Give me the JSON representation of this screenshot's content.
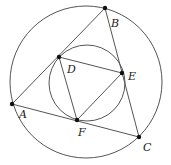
{
  "diagram": {
    "stroke_color": "#555555",
    "point_color": "#111111",
    "outer_circle": {
      "cx": 86,
      "cy": 82,
      "r": 76
    },
    "inner_circle": {
      "cx": 87,
      "cy": 83,
      "r": 38
    },
    "points": {
      "A": {
        "x": 12,
        "y": 104,
        "label": "A",
        "lx": 19,
        "ly": 118
      },
      "B": {
        "x": 105,
        "y": 8,
        "label": "B",
        "lx": 111,
        "ly": 27
      },
      "C": {
        "x": 139,
        "y": 137,
        "label": "C",
        "lx": 143,
        "ly": 151
      },
      "D": {
        "x": 59,
        "y": 57,
        "label": "D",
        "lx": 67,
        "ly": 73
      },
      "E": {
        "x": 122,
        "y": 73,
        "label": "E",
        "lx": 128,
        "ly": 80
      },
      "F": {
        "x": 77,
        "y": 120,
        "label": "F",
        "lx": 78,
        "ly": 136
      }
    },
    "segments": [
      [
        "A",
        "B"
      ],
      [
        "B",
        "C"
      ],
      [
        "C",
        "A"
      ],
      [
        "D",
        "E"
      ],
      [
        "E",
        "F"
      ],
      [
        "F",
        "D"
      ]
    ]
  }
}
